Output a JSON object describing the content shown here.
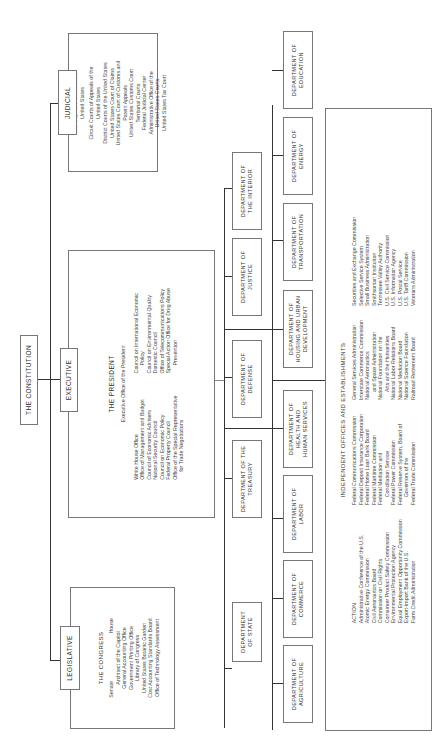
{
  "constitution": {
    "label": "THE CONSTITUTION"
  },
  "branches": {
    "judicial": {
      "label": "JUDICIAL",
      "items": [
        "The Supreme Court of the",
        "United States",
        "Circuit Courts of Appeals of the",
        "United States",
        "District Courts of the United States",
        "United States Court of Claims",
        "United States Court of Customs and",
        "Patent Appeals",
        "United States Customs Court",
        "Territorial Courts",
        "Federal Judicial Center",
        "Administrative Office of the",
        "United States Courts",
        "United States Tax Court"
      ]
    },
    "executive": {
      "label": "EXECUTIVE",
      "title": "THE PRESIDENT",
      "subtitle": "Executive Office of the President",
      "left_items": [
        "White House Office",
        "Office of Management and Budget",
        "Council of Economic Advisers",
        "National Security Council",
        "Council on Economic Policy",
        "Federal Property Council",
        "Office of the Special Representative",
        "for Trade Negotiations"
      ],
      "right_items": [
        "Council on International Economic",
        "Policy",
        "Council on Environmental Quality",
        "Domestic Council",
        "Office of Telecommunications Policy",
        "Special Action Office for Drug Abuse",
        "Prevention"
      ]
    },
    "legislative": {
      "label": "LEGISLATIVE",
      "title": "THE CONGRESS",
      "chambers": [
        "Senate",
        "House"
      ],
      "items": [
        "Architect of the Capitol",
        "General Accounting Office",
        "Government Printing Office",
        "Library of Congress",
        "United States Botanic Garden",
        "Cost Accounting Standards Board",
        "Office of Technology Assessment"
      ]
    }
  },
  "departments": {
    "row_a": [
      {
        "line1": "DEPARTMENT",
        "line2": "OF STATE"
      },
      {
        "line1": "DEPARTMENT OF THE",
        "line2": "TREASURY"
      },
      {
        "line1": "DEPARTMENT OF",
        "line2": "DEFENSE"
      },
      {
        "line1": "DEPARTMENT OF",
        "line2": "JUSTICE"
      },
      {
        "line1": "DEPARTMENT OF",
        "line2": "THE INTERIOR"
      }
    ],
    "row_b": [
      {
        "line1": "DEPARTMENT OF",
        "line2": "AGRICULTURE"
      },
      {
        "line1": "DEPARTMENT OF",
        "line2": "COMMERCE"
      },
      {
        "line1": "DEPARTMENT OF",
        "line2": "LABOR"
      },
      {
        "line1": "DEPARTMENT OF",
        "line2": "HEALTH AND",
        "line3": "HUMAN SERVICES"
      },
      {
        "line1": "DEPARTMENT OF",
        "line2": "HOUSING AND URBAN",
        "line3": "DEVELOPMENT"
      },
      {
        "line1": "DEPARTMENT OF",
        "line2": "TRANSPORTATION"
      },
      {
        "line1": "DEPARTMENT OF",
        "line2": "ENERGY"
      },
      {
        "line1": "DEPARTMENT OF",
        "line2": "EDUCATION"
      }
    ]
  },
  "independent": {
    "title": "INDEPENDENT OFFICES AND ESTABLISHMENTS",
    "col1": [
      "ACTION",
      "Administrative Conference of the U.S.",
      "Atomic Energy Commission",
      "Civil Aeronautics Board",
      "Commission on Civil Rights",
      "Consumer Product Safety Commission",
      "Environmental Protection Agency",
      "Equal Employment Opportunity Commission",
      "Export-Import Bank of the U.S.",
      "Farm Credit Administration"
    ],
    "col2": [
      "Federal Communications Commission",
      "Federal Deposit Insurance Corporation",
      "Federal Home Loan Bank Board",
      "Federal Maritime Commission",
      "Federal Mediation and",
      "Conciliation Service",
      "Federal Power Commission",
      "Federal Reserve System, Board of",
      "Governors of the",
      "Federal Trade Commission"
    ],
    "col3": [
      "General Services Administration",
      "Interstate Commerce Commission",
      "National Aeronautics",
      "and Space Administration",
      "National Foundation on the",
      "Arts and the Humanities",
      "National Labor Relations Board",
      "National Mediation Board",
      "National Science Foundation",
      "Railroad Retirement Board"
    ],
    "col4": [
      "Securities and Exchange Commission",
      "Selective Service System",
      "Small Business Administration",
      "Smithsonian Institution",
      "Tennessee Valley Authority",
      "U.S. Civil Service Commission",
      "U.S. Information Agency",
      "U.S. Postal Service",
      "U.S. Tariff Commission",
      "Veterans Administration"
    ]
  }
}
